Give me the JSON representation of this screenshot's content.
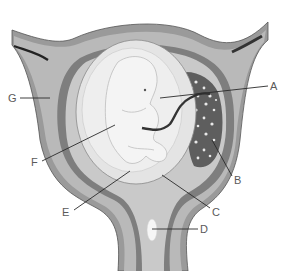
{
  "diagram": {
    "labels": [
      {
        "id": "A",
        "text": "A",
        "points_to": "umbilical cord"
      },
      {
        "id": "B",
        "text": "B",
        "points_to": "placenta"
      },
      {
        "id": "C",
        "text": "C",
        "points_to": "amniotic sac / membrane"
      },
      {
        "id": "D",
        "text": "D",
        "points_to": "cervix / mucus plug"
      },
      {
        "id": "E",
        "text": "E",
        "points_to": "amniotic fluid"
      },
      {
        "id": "F",
        "text": "F",
        "points_to": "embryo"
      },
      {
        "id": "G",
        "text": "G",
        "points_to": "uterine wall"
      }
    ],
    "colors": {
      "outer_wall": "#9a9a9a",
      "inner_wall": "#b9b9b9",
      "lining": "#7e7e7e",
      "sac": "#e4e4e4",
      "fluid": "#eeeeee",
      "embryo": "#f4f4f4",
      "placenta": "#5e5e5e",
      "cord": "#333333",
      "label_text": "#5a5a5a"
    }
  }
}
